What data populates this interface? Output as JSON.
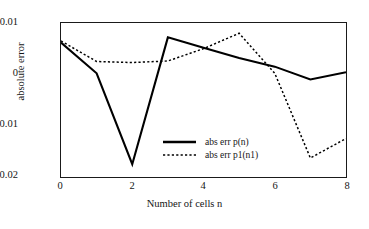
{
  "chart_data": {
    "type": "line",
    "title": "",
    "xlabel": "Number of cells n",
    "ylabel": "absolute error",
    "x": [
      0,
      1,
      2,
      3,
      4,
      5,
      6,
      7,
      8
    ],
    "xlim": [
      0,
      8
    ],
    "ylim": [
      -0.02,
      0.01
    ],
    "xticks": [
      "0",
      "2",
      "4",
      "6",
      "8"
    ],
    "xtick_values": [
      0,
      2,
      4,
      6,
      8
    ],
    "yticks": [
      "0.01",
      "0",
      "-0.01",
      "-0.02"
    ],
    "ytick_values": [
      0.01,
      0,
      -0.01,
      -0.02
    ],
    "grid": false,
    "legend_position": "lower center",
    "series": [
      {
        "name": "abs err p(n)",
        "style": "solid",
        "color": "#000000",
        "values": [
          0.0062,
          0.0002,
          -0.0175,
          0.0072,
          0.0052,
          0.0032,
          0.0015,
          -0.001,
          0.0004
        ]
      },
      {
        "name": "abs err p1(n1)",
        "style": "dotted",
        "color": "#000000",
        "values": [
          0.0065,
          0.0025,
          0.0023,
          0.0026,
          0.005,
          0.008,
          0.0002,
          -0.0163,
          -0.0125
        ]
      }
    ]
  },
  "legend": {
    "entries": [
      {
        "label": "abs err p(n)"
      },
      {
        "label": "abs err p1(n1)"
      }
    ]
  },
  "colors": {
    "axis": "#1a1a1a",
    "text": "#151515",
    "background": "#ffffff",
    "series": "#000000"
  }
}
